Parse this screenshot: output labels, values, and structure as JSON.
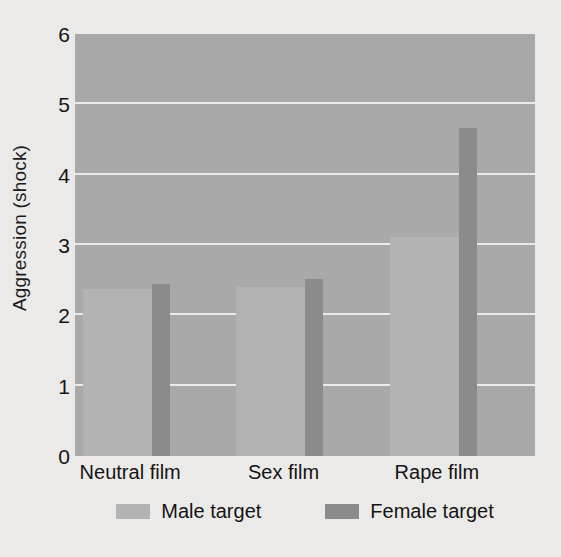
{
  "chart_data": {
    "type": "bar",
    "title": "",
    "subtitle": "",
    "xlabel": "",
    "ylabel": "Aggression (shock)",
    "categories": [
      "Neutral film",
      "Sex film",
      "Rape film"
    ],
    "series": [
      {
        "name": "Male target",
        "color": "#b3b3b3",
        "values": [
          2.37,
          2.4,
          3.11
        ]
      },
      {
        "name": "Female target",
        "color": "#8b8b8b",
        "values": [
          2.45,
          2.52,
          4.66
        ]
      }
    ],
    "ylim": [
      0,
      6
    ],
    "y_ticks": [
      "0",
      "1",
      "2",
      "3",
      "4",
      "5",
      "6"
    ],
    "grid": true,
    "legend_position": "bottom",
    "plot_background": "#a9a9a9",
    "gridline_color": "#f0f0ee",
    "figure_background": "#eceae8"
  },
  "legend": {
    "entries": [
      {
        "label": "Male target",
        "swatch": "male-swatch"
      },
      {
        "label": "Female target",
        "swatch": "female-swatch"
      }
    ]
  }
}
